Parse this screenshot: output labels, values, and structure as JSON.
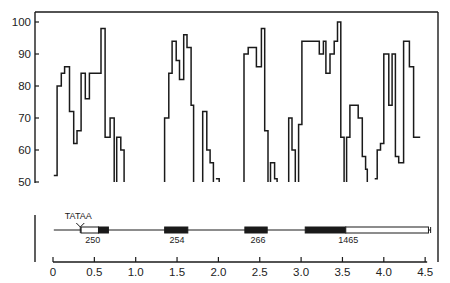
{
  "chart_data": {
    "type": "line",
    "title": "",
    "xlabel": "",
    "ylabel": "",
    "xlim": [
      0,
      4.5
    ],
    "ylim": [
      50,
      100
    ],
    "x_ticks": [
      "0",
      "0.5",
      "1.0",
      "1.5",
      "2.0",
      "2.5",
      "3.0",
      "3.5",
      "4.0",
      "4.5"
    ],
    "y_ticks": [
      "50",
      "60",
      "70",
      "80",
      "90",
      "100"
    ],
    "grid": false,
    "legend": null,
    "series": [
      {
        "name": "trace",
        "style": "step",
        "segments": [
          [
            [
              0.01,
              52
            ],
            [
              0.05,
              52
            ],
            [
              0.05,
              80
            ],
            [
              0.1,
              80
            ],
            [
              0.1,
              84
            ],
            [
              0.14,
              84
            ],
            [
              0.14,
              86
            ],
            [
              0.2,
              86
            ],
            [
              0.2,
              72
            ],
            [
              0.25,
              72
            ],
            [
              0.25,
              62
            ],
            [
              0.29,
              62
            ],
            [
              0.29,
              66
            ],
            [
              0.34,
              66
            ],
            [
              0.34,
              84
            ],
            [
              0.39,
              84
            ],
            [
              0.39,
              76
            ],
            [
              0.44,
              76
            ],
            [
              0.44,
              84
            ],
            [
              0.58,
              84
            ],
            [
              0.58,
              98
            ],
            [
              0.63,
              98
            ],
            [
              0.63,
              64
            ],
            [
              0.69,
              64
            ],
            [
              0.69,
              70
            ],
            [
              0.74,
              70
            ],
            [
              0.74,
              50
            ]
          ],
          [
            [
              0.77,
              50
            ],
            [
              0.77,
              64
            ],
            [
              0.82,
              64
            ],
            [
              0.82,
              60
            ],
            [
              0.86,
              60
            ],
            [
              0.86,
              50
            ]
          ],
          [
            [
              1.35,
              50
            ],
            [
              1.35,
              70
            ],
            [
              1.4,
              70
            ],
            [
              1.4,
              84
            ],
            [
              1.44,
              84
            ],
            [
              1.44,
              94
            ],
            [
              1.49,
              94
            ],
            [
              1.49,
              88
            ],
            [
              1.53,
              88
            ],
            [
              1.53,
              82
            ],
            [
              1.58,
              82
            ],
            [
              1.58,
              96
            ],
            [
              1.62,
              96
            ],
            [
              1.62,
              92
            ],
            [
              1.67,
              92
            ],
            [
              1.67,
              74
            ],
            [
              1.7,
              74
            ],
            [
              1.7,
              50
            ]
          ],
          [
            [
              1.81,
              50
            ],
            [
              1.81,
              72
            ],
            [
              1.86,
              72
            ],
            [
              1.86,
              60
            ],
            [
              1.9,
              60
            ],
            [
              1.9,
              56
            ],
            [
              1.94,
              56
            ],
            [
              1.94,
              50
            ]
          ],
          [
            [
              1.97,
              51
            ],
            [
              2.01,
              51
            ],
            [
              2.01,
              50
            ]
          ],
          [
            [
              2.31,
              50
            ],
            [
              2.31,
              90
            ],
            [
              2.36,
              90
            ],
            [
              2.36,
              92
            ],
            [
              2.46,
              92
            ],
            [
              2.46,
              86
            ],
            [
              2.52,
              86
            ],
            [
              2.52,
              98
            ],
            [
              2.56,
              98
            ],
            [
              2.56,
              66
            ],
            [
              2.6,
              66
            ],
            [
              2.6,
              50
            ]
          ],
          [
            [
              2.63,
              50
            ],
            [
              2.63,
              56
            ],
            [
              2.68,
              56
            ],
            [
              2.68,
              51
            ],
            [
              2.71,
              51
            ],
            [
              2.71,
              50
            ]
          ],
          [
            [
              2.85,
              50
            ],
            [
              2.85,
              70
            ],
            [
              2.89,
              70
            ],
            [
              2.89,
              60
            ],
            [
              2.93,
              60
            ],
            [
              2.93,
              50
            ]
          ],
          [
            [
              2.97,
              50
            ],
            [
              2.97,
              68
            ],
            [
              3.01,
              68
            ],
            [
              3.01,
              94
            ],
            [
              3.22,
              94
            ],
            [
              3.22,
              90
            ],
            [
              3.27,
              90
            ],
            [
              3.27,
              94
            ],
            [
              3.3,
              94
            ],
            [
              3.3,
              84
            ],
            [
              3.35,
              84
            ],
            [
              3.35,
              90
            ],
            [
              3.4,
              90
            ],
            [
              3.4,
              94
            ],
            [
              3.44,
              94
            ],
            [
              3.44,
              100
            ],
            [
              3.48,
              100
            ],
            [
              3.48,
              64
            ],
            [
              3.52,
              64
            ],
            [
              3.52,
              50
            ]
          ],
          [
            [
              3.55,
              50
            ],
            [
              3.55,
              64
            ],
            [
              3.59,
              64
            ],
            [
              3.59,
              74
            ],
            [
              3.69,
              74
            ],
            [
              3.69,
              70
            ],
            [
              3.74,
              70
            ],
            [
              3.74,
              58
            ],
            [
              3.78,
              58
            ],
            [
              3.78,
              54
            ],
            [
              3.8,
              54
            ],
            [
              3.8,
              50
            ]
          ],
          [
            [
              3.89,
              51
            ],
            [
              3.92,
              51
            ],
            [
              3.92,
              60
            ],
            [
              3.96,
              60
            ],
            [
              3.96,
              62
            ],
            [
              4.0,
              62
            ],
            [
              4.0,
              90
            ],
            [
              4.06,
              90
            ],
            [
              4.06,
              74
            ],
            [
              4.1,
              74
            ],
            [
              4.1,
              90
            ],
            [
              4.14,
              90
            ],
            [
              4.14,
              58
            ],
            [
              4.18,
              58
            ],
            [
              4.18,
              56
            ],
            [
              4.24,
              56
            ],
            [
              4.24,
              94
            ],
            [
              4.31,
              94
            ],
            [
              4.31,
              86
            ],
            [
              4.36,
              86
            ],
            [
              4.36,
              64
            ],
            [
              4.44,
              64
            ]
          ]
        ]
      }
    ],
    "gene_map": {
      "line_range": [
        0.01,
        4.53
      ],
      "promoter_label": "TATAA",
      "promoter_pos": 0.33,
      "exons": [
        {
          "start": 0.34,
          "end": 0.55,
          "fill": "open",
          "label": "250"
        },
        {
          "start": 0.55,
          "end": 0.67,
          "fill": "solid",
          "label": ""
        },
        {
          "start": 1.35,
          "end": 1.63,
          "fill": "solid",
          "label": "254"
        },
        {
          "start": 2.32,
          "end": 2.59,
          "fill": "solid",
          "label": "266"
        },
        {
          "start": 3.05,
          "end": 3.54,
          "fill": "solid",
          "label": "1465"
        },
        {
          "start": 3.54,
          "end": 4.54,
          "fill": "open",
          "label": ""
        }
      ],
      "label_positions": {
        "250": 0.48,
        "254": 1.5,
        "266": 2.48,
        "1465": 3.57
      }
    },
    "colors": {
      "ink": "#1a1a1a",
      "background": "#ffffff"
    }
  }
}
